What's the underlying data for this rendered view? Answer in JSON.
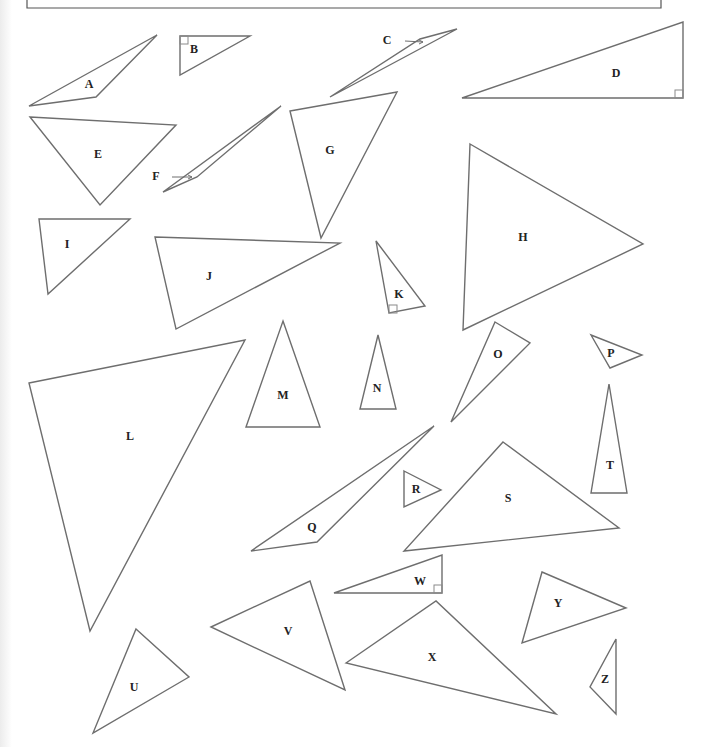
{
  "figure": {
    "stroke_color": "#6e6e6e",
    "triangles": [
      {
        "label": "A",
        "points": "29,106 157,35 96,97",
        "lx": 89,
        "ly": 85
      },
      {
        "label": "B",
        "points": "180,36 250,36 180,75",
        "lx": 194,
        "ly": 50,
        "right_angle": "180,36,8,8"
      },
      {
        "label": "C",
        "points": "330,97 457,29 420,39",
        "lx": 387,
        "ly": 41,
        "arrow": "397,41 423,42"
      },
      {
        "label": "D",
        "points": "462,98 683,22 683,98",
        "lx": 616,
        "ly": 74,
        "right_angle": "675,90,8,8"
      },
      {
        "label": "E",
        "points": "30,117 176,125 100,205",
        "lx": 98,
        "ly": 155
      },
      {
        "label": "F",
        "points": "163,192 281,106 197,177",
        "lx": 156,
        "ly": 177,
        "arrow": "164,177 192,177"
      },
      {
        "label": "G",
        "points": "290,111 397,92 321,238",
        "lx": 330,
        "ly": 151
      },
      {
        "label": "H",
        "points": "470,144 643,244 463,330",
        "lx": 523,
        "ly": 238
      },
      {
        "label": "I",
        "points": "39,219 130,219 48,294",
        "lx": 67,
        "ly": 245
      },
      {
        "label": "J",
        "points": "155,237 340,243 176,329",
        "lx": 209,
        "ly": 277
      },
      {
        "label": "K",
        "points": "376,241 425,306 389,313",
        "lx": 399,
        "ly": 295,
        "right_angle": "389,305,8,8"
      },
      {
        "label": "L",
        "points": "29,383 245,340 90,631",
        "lx": 130,
        "ly": 437
      },
      {
        "label": "M",
        "points": "283,321 320,427 246,427",
        "lx": 283,
        "ly": 396
      },
      {
        "label": "N",
        "points": "378,335 396,409 360,409",
        "lx": 377,
        "ly": 389
      },
      {
        "label": "O",
        "points": "495,322 530,343 451,422",
        "lx": 498,
        "ly": 355
      },
      {
        "label": "P",
        "points": "591,335 642,355 610,368",
        "lx": 611,
        "ly": 354
      },
      {
        "label": "Q",
        "points": "251,551 434,426 317,542",
        "lx": 312,
        "ly": 528
      },
      {
        "label": "R",
        "points": "404,471 441,490 404,507",
        "lx": 416,
        "ly": 490
      },
      {
        "label": "S",
        "points": "503,442 619,528 404,551",
        "lx": 508,
        "ly": 499
      },
      {
        "label": "T",
        "points": "609,384 627,493 591,493",
        "lx": 610,
        "ly": 466
      },
      {
        "label": "U",
        "points": "136,629 189,677 93,733",
        "lx": 134,
        "ly": 688
      },
      {
        "label": "V",
        "points": "211,627 310,581 345,690",
        "lx": 288,
        "ly": 632
      },
      {
        "label": "W",
        "points": "334,593 442,555 442,593",
        "lx": 420,
        "ly": 582,
        "right_angle": "434,585,8,8"
      },
      {
        "label": "X",
        "points": "346,663 436,601 556,714",
        "lx": 432,
        "ly": 658
      },
      {
        "label": "Y",
        "points": "542,572 626,608 522,643",
        "lx": 558,
        "ly": 604
      },
      {
        "label": "Z",
        "points": "616,639 616,714 590,687",
        "lx": 605,
        "ly": 680
      }
    ]
  }
}
